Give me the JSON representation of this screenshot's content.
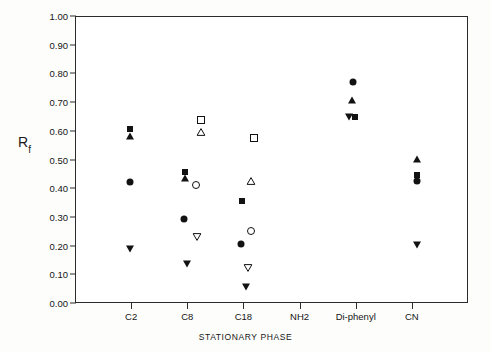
{
  "figure": {
    "y_axis_label_main": "R",
    "y_axis_label_sub": "f",
    "x_axis_title": "STATIONARY PHASE"
  },
  "chart_data": {
    "type": "scatter",
    "title": "",
    "xlabel": "STATIONARY PHASE",
    "ylabel": "Rf",
    "ylim": [
      0.0,
      1.0
    ],
    "ytick_labels": [
      "0.00",
      "0.10",
      "0.20",
      "0.30",
      "0.40",
      "0.50",
      "0.60",
      "0.70",
      "0.80",
      "0.90",
      "1.00"
    ],
    "ytick_values": [
      0.0,
      0.1,
      0.2,
      0.3,
      0.4,
      0.5,
      0.6,
      0.7,
      0.8,
      0.9,
      1.0
    ],
    "categories": [
      "C2",
      "C8",
      "C18",
      "NH2",
      "Di-phenyl",
      "CN"
    ],
    "grid": false,
    "legend": "none",
    "marker_kinds": [
      "square-filled",
      "square-open",
      "circle-filled",
      "circle-open",
      "triangle-filled",
      "triangle-open",
      "triangledown-filled",
      "triangledown-open"
    ],
    "points": [
      {
        "category": "C2",
        "x_offset": -0.04,
        "y": 0.61,
        "marker": "square-filled"
      },
      {
        "category": "C2",
        "x_offset": -0.04,
        "y": 0.585,
        "marker": "triangle-filled"
      },
      {
        "category": "C2",
        "x_offset": -0.04,
        "y": 0.425,
        "marker": "circle-filled"
      },
      {
        "category": "C2",
        "x_offset": -0.04,
        "y": 0.19,
        "marker": "triangledown-filled"
      },
      {
        "category": "C8",
        "x_offset": 0.22,
        "y": 0.64,
        "marker": "square-open"
      },
      {
        "category": "C8",
        "x_offset": 0.22,
        "y": 0.6,
        "marker": "triangle-open"
      },
      {
        "category": "C8",
        "x_offset": -0.06,
        "y": 0.46,
        "marker": "square-filled"
      },
      {
        "category": "C8",
        "x_offset": -0.06,
        "y": 0.44,
        "marker": "triangle-filled"
      },
      {
        "category": "C8",
        "x_offset": 0.14,
        "y": 0.415,
        "marker": "circle-open"
      },
      {
        "category": "C8",
        "x_offset": -0.07,
        "y": 0.295,
        "marker": "circle-filled"
      },
      {
        "category": "C8",
        "x_offset": 0.15,
        "y": 0.235,
        "marker": "triangledown-open"
      },
      {
        "category": "C8",
        "x_offset": -0.03,
        "y": 0.14,
        "marker": "triangledown-filled"
      },
      {
        "category": "C18",
        "x_offset": 0.17,
        "y": 0.58,
        "marker": "square-open"
      },
      {
        "category": "C18",
        "x_offset": 0.11,
        "y": 0.43,
        "marker": "triangle-open"
      },
      {
        "category": "C18",
        "x_offset": -0.04,
        "y": 0.36,
        "marker": "square-filled"
      },
      {
        "category": "C18",
        "x_offset": 0.11,
        "y": 0.255,
        "marker": "circle-open"
      },
      {
        "category": "C18",
        "x_offset": -0.06,
        "y": 0.21,
        "marker": "circle-filled"
      },
      {
        "category": "C18",
        "x_offset": 0.07,
        "y": 0.125,
        "marker": "triangledown-open"
      },
      {
        "category": "C18",
        "x_offset": 0.02,
        "y": 0.06,
        "marker": "triangledown-filled"
      },
      {
        "category": "Di-phenyl",
        "x_offset": -0.06,
        "y": 0.775,
        "marker": "circle-filled"
      },
      {
        "category": "Di-phenyl",
        "x_offset": -0.08,
        "y": 0.71,
        "marker": "triangle-filled"
      },
      {
        "category": "Di-phenyl",
        "x_offset": -0.14,
        "y": 0.65,
        "marker": "triangledown-filled"
      },
      {
        "category": "Di-phenyl",
        "x_offset": -0.03,
        "y": 0.65,
        "marker": "square-filled"
      },
      {
        "category": "CN",
        "x_offset": 0.08,
        "y": 0.505,
        "marker": "triangle-filled"
      },
      {
        "category": "CN",
        "x_offset": 0.08,
        "y": 0.45,
        "marker": "square-filled"
      },
      {
        "category": "CN",
        "x_offset": 0.08,
        "y": 0.43,
        "marker": "circle-filled"
      },
      {
        "category": "CN",
        "x_offset": 0.08,
        "y": 0.205,
        "marker": "triangledown-filled"
      }
    ]
  }
}
